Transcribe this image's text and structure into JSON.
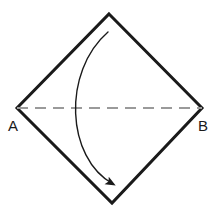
{
  "figure": {
    "background_color": "#ffffff",
    "stroke_color": "#1a1a1a",
    "dashed_color": "#9a9a9a",
    "shape": {
      "name": "square-rotated-45",
      "vertices": [
        {
          "name": "top",
          "x": 109,
          "y": 14,
          "label": ""
        },
        {
          "name": "right",
          "x": 202,
          "y": 108,
          "label": "B"
        },
        {
          "name": "bottom",
          "x": 112,
          "y": 203,
          "label": ""
        },
        {
          "name": "left",
          "x": 17,
          "y": 108,
          "label": "A"
        }
      ],
      "stroke_width": 3
    },
    "diagonal": {
      "name": "diagonal-AB",
      "from": "A",
      "to": "B",
      "x1": 17,
      "y1": 108,
      "x2": 202,
      "y2": 108,
      "style": "dashed",
      "dash_pattern": "11 7",
      "stroke_width": 2.2
    },
    "fold_arrow": {
      "name": "fold-arrow",
      "from_vertex": "top",
      "to_vertex": "bottom",
      "start_x": 108,
      "start_y": 32,
      "end_x": 115,
      "end_y": 186,
      "control1_x": 62,
      "control1_y": 72,
      "control2_x": 66,
      "control2_y": 158,
      "stroke_width": 1.4,
      "arrowhead": "filled-triangle"
    },
    "labels": {
      "left_vertex": "A",
      "right_vertex": "B",
      "left_label_x": 13,
      "left_label_y": 130,
      "right_label_x": 201,
      "right_label_y": 130
    }
  }
}
